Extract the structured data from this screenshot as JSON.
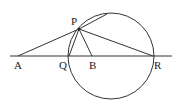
{
  "diagram": {
    "type": "geometry",
    "points": {
      "A": {
        "label": "A",
        "x": 18,
        "y": 56,
        "lx": 14,
        "ly": 69
      },
      "P": {
        "label": "P",
        "x": 79,
        "y": 29,
        "lx": 71,
        "ly": 25
      },
      "Q": {
        "label": "Q",
        "x": 69,
        "y": 56,
        "lx": 59,
        "ly": 69
      },
      "B": {
        "label": "B",
        "x": 92,
        "y": 56,
        "lx": 89,
        "ly": 69
      },
      "R": {
        "label": "R",
        "x": 153,
        "y": 56,
        "lx": 154,
        "ly": 69
      }
    },
    "circle": {
      "cx": 111,
      "cy": 56,
      "r": 43
    },
    "segments": [
      "AP",
      "PQ",
      "PB",
      "PR",
      "line AR",
      "tangent at P"
    ],
    "colors": {
      "stroke": "#333333",
      "background": "#ffffff"
    }
  }
}
